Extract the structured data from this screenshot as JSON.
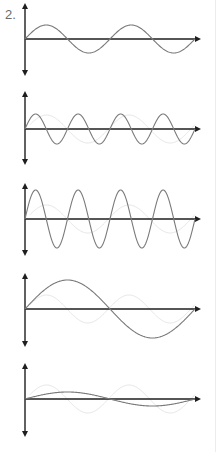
{
  "question_label": "2.",
  "colors": {
    "axis": "#1e1e1e",
    "wave": "#7a7a7a",
    "ghost": "#e6e6e6",
    "label": "#6a6a6a"
  },
  "panels": [
    {
      "name": "wave-panel-1",
      "axis_y": 39,
      "top": 3,
      "bottom": 76,
      "amplitude": 14,
      "cycles": 2
    },
    {
      "name": "wave-panel-2",
      "axis_y": 129,
      "top": 91,
      "bottom": 165,
      "amplitude": 15,
      "cycles": 4
    },
    {
      "name": "wave-panel-3",
      "axis_y": 219,
      "top": 183,
      "bottom": 256,
      "amplitude": 29,
      "cycles": 4
    },
    {
      "name": "wave-panel-4",
      "axis_y": 309,
      "top": 273,
      "bottom": 347,
      "amplitude": 29,
      "cycles": 1
    },
    {
      "name": "wave-panel-5",
      "axis_y": 399,
      "top": 363,
      "bottom": 437,
      "amplitude": 7,
      "cycles": 1
    }
  ],
  "layout": {
    "axis_x": 25,
    "x_arrow_end": 201,
    "wave_end_x": 195
  }
}
